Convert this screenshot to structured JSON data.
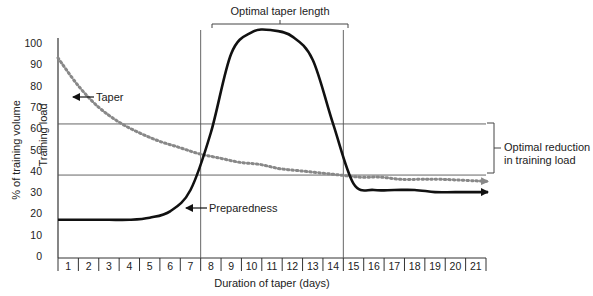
{
  "chart_data": {
    "type": "line",
    "title": "",
    "xlabel": "Duration of taper (days)",
    "ylabel_outer": "% of training volume",
    "ylabel_inner": "Training load",
    "x": [
      1,
      2,
      3,
      4,
      5,
      6,
      7,
      8,
      9,
      10,
      11,
      12,
      13,
      14,
      15,
      16,
      17,
      18,
      19,
      20,
      21
    ],
    "x_tick_labels": [
      "1",
      "2",
      "3",
      "4",
      "5",
      "6",
      "7",
      "8",
      "9",
      "10",
      "11",
      "12",
      "13",
      "14",
      "15",
      "16",
      "17",
      "18",
      "19",
      "20",
      "21"
    ],
    "y_tick_labels": [
      "0",
      "10",
      "20",
      "30",
      "40",
      "50",
      "60",
      "70",
      "80",
      "90",
      "100"
    ],
    "ylim": [
      0,
      100
    ],
    "series": [
      {
        "name": "Taper",
        "style": "dotted",
        "values": [
          93,
          80,
          70,
          63,
          58,
          54,
          51,
          48,
          46,
          44,
          43,
          41,
          40,
          39,
          38,
          37,
          37,
          36,
          36,
          36,
          35
        ]
      },
      {
        "name": "Preparedness",
        "style": "solid",
        "values": [
          17,
          17,
          17,
          17,
          18,
          21,
          31,
          58,
          95,
          105,
          106,
          103,
          92,
          62,
          34,
          31,
          31,
          31,
          30,
          30,
          30
        ]
      }
    ],
    "reference_lines": {
      "horizontal": [
        62,
        38
      ],
      "vertical_days": [
        8,
        14
      ]
    },
    "annotations": [
      {
        "text": "Optimal taper length",
        "spans_days": [
          8,
          14
        ]
      },
      {
        "text": "Optimal reduction",
        "text2": "in training load",
        "spans_percent": [
          38,
          62
        ]
      },
      {
        "text": "Taper",
        "points_to": "dotted curve"
      },
      {
        "text": "Preparedness",
        "points_to": "solid curve"
      }
    ],
    "grid": false,
    "legend": "inline annotations"
  },
  "labels": {
    "xlabel": "Duration of taper (days)",
    "ylabel_outer": "% of training volume",
    "ylabel_inner": "Training load",
    "bracket_top": "Optimal taper length",
    "bracket_right_1": "Optimal reduction",
    "bracket_right_2": "in training load",
    "taper": "Taper",
    "preparedness": "Preparedness"
  }
}
